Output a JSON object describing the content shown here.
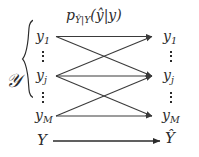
{
  "figure": {
    "kernel_label": {
      "p": "p",
      "subscript": "Ŷ|Y",
      "args": "(ŷ|y)"
    },
    "alphabet_symbol": "𝒴",
    "left_column": {
      "nodes": [
        {
          "base": "y",
          "sub": "1",
          "label": "y1"
        },
        {
          "base": "y",
          "sub": "j",
          "label": "yj"
        },
        {
          "base": "y",
          "sub": "M",
          "label": "yM"
        }
      ],
      "ellipsis_between": [
        "⋮",
        "⋮"
      ]
    },
    "right_column": {
      "nodes": [
        {
          "base": "y",
          "sub": "1",
          "label": "y1"
        },
        {
          "base": "y",
          "sub": "j",
          "label": "yj"
        },
        {
          "base": "y",
          "sub": "M",
          "label": "yM"
        }
      ],
      "ellipsis_between": [
        "⋮",
        "⋮"
      ]
    },
    "bottom_row": {
      "source": "Y",
      "target": "Ŷ"
    },
    "colors": {
      "ink": "#2b2b2b",
      "edge": "#3a3a3a",
      "background": "#ffffff"
    },
    "edges": [
      {
        "from": "y1",
        "to": "y1"
      },
      {
        "from": "y1",
        "to": "yj"
      },
      {
        "from": "yj",
        "to": "y1"
      },
      {
        "from": "yj",
        "to": "yj"
      },
      {
        "from": "yj",
        "to": "yM"
      },
      {
        "from": "yM",
        "to": "yj"
      },
      {
        "from": "yM",
        "to": "yM"
      },
      {
        "from": "Y",
        "to": "Yhat"
      }
    ]
  }
}
